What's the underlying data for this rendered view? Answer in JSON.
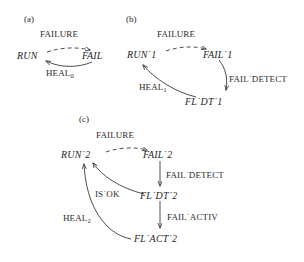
{
  "figure": {
    "background_color": "#ffffff",
    "ink_color": "#1f1f1f",
    "separator": "˙"
  },
  "panels": [
    {
      "id": "a",
      "label": "(a)",
      "states": [
        {
          "name": "state-run",
          "text": "RUN"
        },
        {
          "name": "state-fail",
          "text": "FAIL"
        }
      ],
      "edges": [
        {
          "name": "edge-failure",
          "label": "FAILURE",
          "style": "dashed",
          "from": "RUN",
          "to": "FAIL"
        },
        {
          "name": "edge-heal",
          "label": "HEAL",
          "subscript": "0",
          "style": "solid",
          "from": "FAIL",
          "to": "RUN"
        }
      ]
    },
    {
      "id": "b",
      "label": "(b)",
      "states": [
        {
          "name": "state-run-1",
          "text": "RUN˙1"
        },
        {
          "name": "state-fail-1",
          "text": "FAIL˙1"
        },
        {
          "name": "state-fl-dt-1",
          "text": "FL˙DT˙1"
        }
      ],
      "edges": [
        {
          "name": "edge-failure",
          "label": "FAILURE",
          "style": "dashed",
          "from": "RUN˙1",
          "to": "FAIL˙1"
        },
        {
          "name": "edge-fail-detect",
          "label": "FAIL˙DETECT",
          "style": "solid",
          "from": "FAIL˙1",
          "to": "FL˙DT˙1"
        },
        {
          "name": "edge-heal",
          "label": "HEAL",
          "subscript": "1",
          "style": "solid",
          "from": "FL˙DT˙1",
          "to": "RUN˙1"
        }
      ]
    },
    {
      "id": "c",
      "label": "(c)",
      "states": [
        {
          "name": "state-run-2",
          "text": "RUN˙2"
        },
        {
          "name": "state-fail-2",
          "text": "FAIL˙2"
        },
        {
          "name": "state-fl-dt-2",
          "text": "FL˙DT˙2"
        },
        {
          "name": "state-fl-act-2",
          "text": "FL˙ACT˙2"
        }
      ],
      "edges": [
        {
          "name": "edge-failure",
          "label": "FAILURE",
          "style": "dashed",
          "from": "RUN˙2",
          "to": "FAIL˙2"
        },
        {
          "name": "edge-fail-detect",
          "label": "FAIL˙DETECT",
          "style": "solid",
          "from": "FAIL˙2",
          "to": "FL˙DT˙2"
        },
        {
          "name": "edge-fail-activ",
          "label": "FAIL˙ACTIV",
          "style": "solid",
          "from": "FL˙DT˙2",
          "to": "FL˙ACT˙2"
        },
        {
          "name": "edge-is-ok",
          "label": "IS˙OK",
          "style": "solid",
          "from": "FL˙DT˙2",
          "to": "RUN˙2"
        },
        {
          "name": "edge-heal",
          "label": "HEAL",
          "subscript": "2",
          "style": "solid",
          "from": "FL˙ACT˙2",
          "to": "RUN˙2"
        }
      ]
    }
  ]
}
